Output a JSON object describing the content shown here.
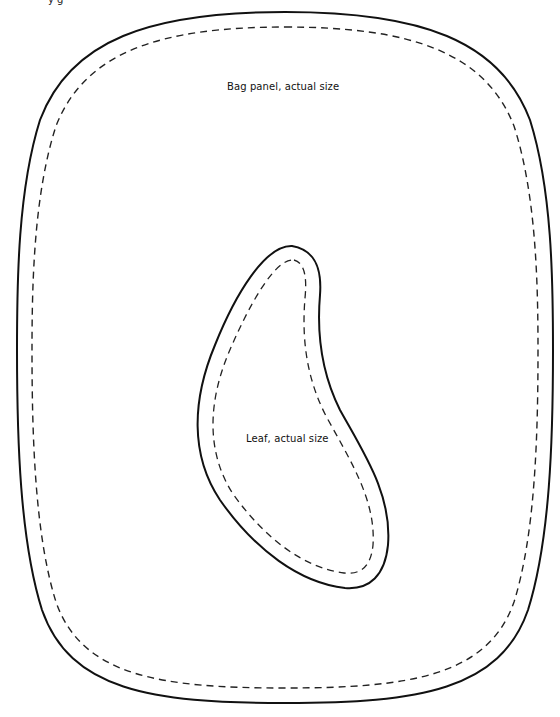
{
  "page": {
    "header_fragment": "y g"
  },
  "pieces": [
    {
      "id": "bag-panel",
      "label": "Bag panel, actual size",
      "cut_line": "solid",
      "seam_line": "dashed"
    },
    {
      "id": "leaf",
      "label": "Leaf, actual size",
      "cut_line": "solid",
      "seam_line": "dashed"
    }
  ],
  "colors": {
    "line": "#111111",
    "background": "#ffffff"
  }
}
